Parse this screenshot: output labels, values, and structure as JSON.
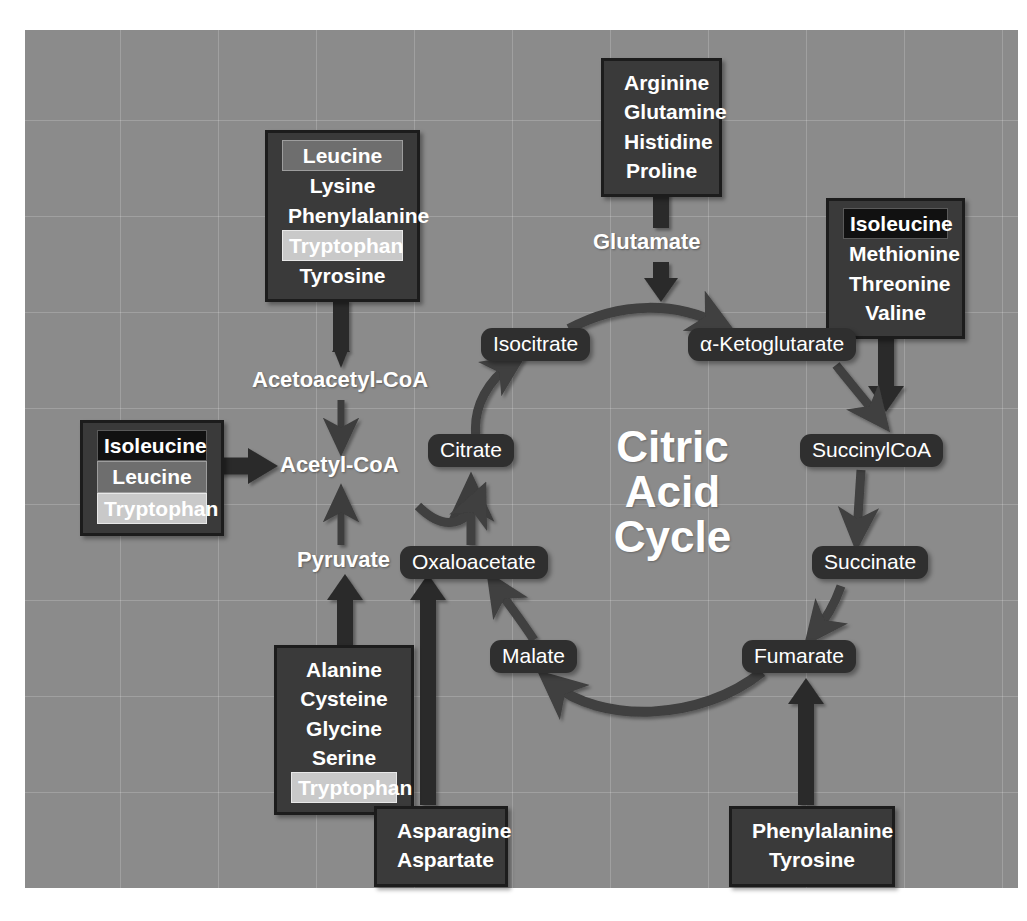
{
  "figure": {
    "panel_bg": "#8b8b8b",
    "box_bg": "#3a3a3a",
    "pill_bg": "#2f2f2f",
    "text_color": "#ffffff"
  },
  "cycle_title": {
    "line1": "Citric",
    "line2": "Acid",
    "line3": "Cycle"
  },
  "cycle_pills": [
    {
      "id": "isocitrate",
      "label": "Isocitrate"
    },
    {
      "id": "alpha-ketoglutarate",
      "label": "α-Ketoglutarate"
    },
    {
      "id": "citrate",
      "label": "Citrate"
    },
    {
      "id": "succinylcoa",
      "label": "SuccinylCoA"
    },
    {
      "id": "oxaloacetate",
      "label": "Oxaloacetate"
    },
    {
      "id": "succinate",
      "label": "Succinate"
    },
    {
      "id": "malate",
      "label": "Malate"
    },
    {
      "id": "fumarate",
      "label": "Fumarate"
    }
  ],
  "plain_labels": [
    {
      "id": "glutamate",
      "label": "Glutamate"
    },
    {
      "id": "acetoacetyl-coa",
      "label": "Acetoacetyl-CoA"
    },
    {
      "id": "acetyl-coa",
      "label": "Acetyl-CoA"
    },
    {
      "id": "pyruvate",
      "label": "Pyruvate"
    }
  ],
  "amino_acid_boxes": [
    {
      "id": "box-acetoacetyl",
      "target": "Acetoacetyl-CoA",
      "items": [
        {
          "name": "Leucine",
          "highlight": "mid"
        },
        {
          "name": "Lysine",
          "highlight": "none"
        },
        {
          "name": "Phenylalanine",
          "highlight": "none"
        },
        {
          "name": "Tryptophan",
          "highlight": "light"
        },
        {
          "name": "Tyrosine",
          "highlight": "none"
        }
      ]
    },
    {
      "id": "box-glutamate",
      "target": "Glutamate",
      "items": [
        {
          "name": "Arginine",
          "highlight": "none"
        },
        {
          "name": "Glutamine",
          "highlight": "none"
        },
        {
          "name": "Histidine",
          "highlight": "none"
        },
        {
          "name": "Proline",
          "highlight": "none"
        }
      ]
    },
    {
      "id": "box-succinylcoa",
      "target": "SuccinylCoA",
      "items": [
        {
          "name": "Isoleucine",
          "highlight": "dark"
        },
        {
          "name": "Methionine",
          "highlight": "none"
        },
        {
          "name": "Threonine",
          "highlight": "none"
        },
        {
          "name": "Valine",
          "highlight": "none"
        }
      ]
    },
    {
      "id": "box-acetylcoa",
      "target": "Acetyl-CoA",
      "items": [
        {
          "name": "Isoleucine",
          "highlight": "dark"
        },
        {
          "name": "Leucine",
          "highlight": "mid"
        },
        {
          "name": "Tryptophan",
          "highlight": "light"
        }
      ]
    },
    {
      "id": "box-pyruvate",
      "target": "Pyruvate",
      "items": [
        {
          "name": "Alanine",
          "highlight": "none"
        },
        {
          "name": "Cysteine",
          "highlight": "none"
        },
        {
          "name": "Glycine",
          "highlight": "none"
        },
        {
          "name": "Serine",
          "highlight": "none"
        },
        {
          "name": "Tryptophan",
          "highlight": "light"
        }
      ]
    },
    {
      "id": "box-oxaloacetate",
      "target": "Oxaloacetate",
      "items": [
        {
          "name": "Asparagine",
          "highlight": "none"
        },
        {
          "name": "Aspartate",
          "highlight": "none"
        }
      ]
    },
    {
      "id": "box-fumarate",
      "target": "Fumarate",
      "items": [
        {
          "name": "Phenylalanine",
          "highlight": "none"
        },
        {
          "name": "Tyrosine",
          "highlight": "none"
        }
      ]
    }
  ]
}
